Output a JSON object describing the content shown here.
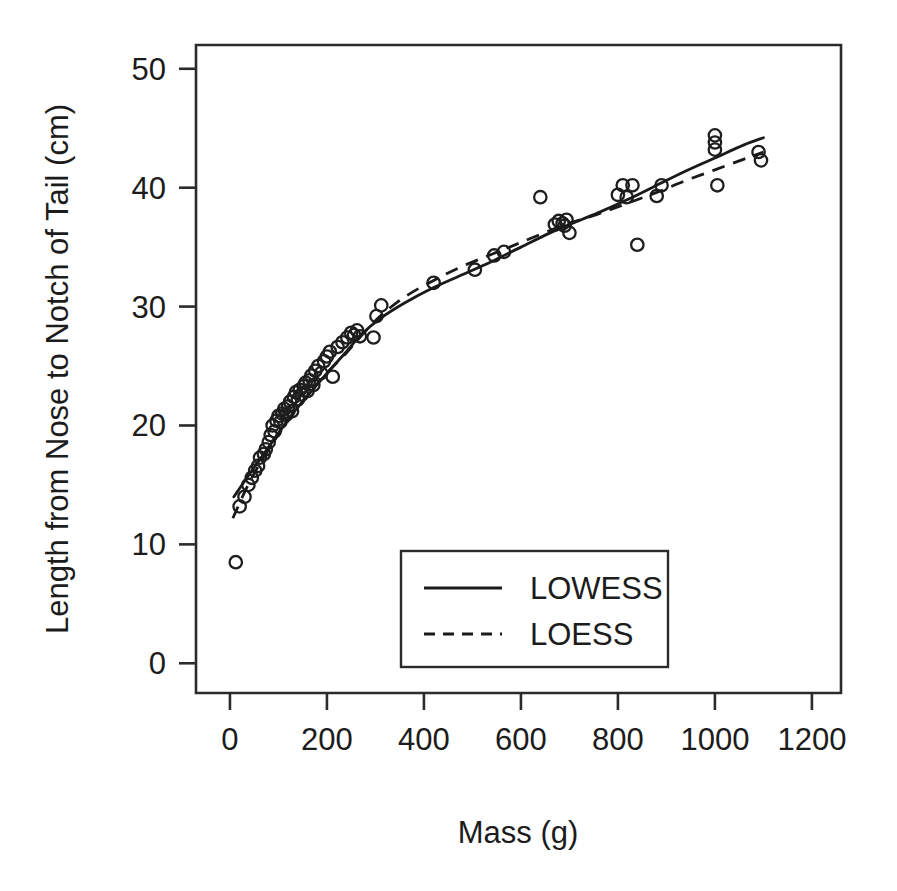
{
  "chart_data": {
    "type": "scatter",
    "title": "",
    "xlabel": "Mass (g)",
    "ylabel": "Length from Nose to Notch of Tail (cm)",
    "xlim": [
      -70,
      1260
    ],
    "ylim": [
      -2.5,
      52
    ],
    "xticks": [
      0,
      200,
      400,
      600,
      800,
      1000,
      1200
    ],
    "yticks": [
      0,
      10,
      20,
      30,
      40,
      50
    ],
    "xtick_labels": [
      "0",
      "200",
      "400",
      "600",
      "800",
      "1000",
      "1200"
    ],
    "ytick_labels": [
      "0",
      "10",
      "20",
      "30",
      "40",
      "50"
    ],
    "grid": false,
    "legend_position": "bottom-center-inside",
    "marker": "open-circle",
    "points": [
      [
        12,
        8.5
      ],
      [
        20,
        13.2
      ],
      [
        30,
        14.0
      ],
      [
        38,
        15.0
      ],
      [
        45,
        15.6
      ],
      [
        52,
        16.2
      ],
      [
        58,
        16.6
      ],
      [
        62,
        17.3
      ],
      [
        70,
        17.6
      ],
      [
        74,
        18.0
      ],
      [
        80,
        18.6
      ],
      [
        84,
        19.2
      ],
      [
        88,
        20.0
      ],
      [
        92,
        19.5
      ],
      [
        96,
        20.4
      ],
      [
        100,
        20.8
      ],
      [
        104,
        20.3
      ],
      [
        108,
        21.0
      ],
      [
        112,
        21.4
      ],
      [
        116,
        20.9
      ],
      [
        120,
        21.6
      ],
      [
        124,
        22.0
      ],
      [
        128,
        21.2
      ],
      [
        132,
        22.4
      ],
      [
        136,
        22.8
      ],
      [
        140,
        22.2
      ],
      [
        144,
        23.0
      ],
      [
        148,
        22.6
      ],
      [
        152,
        23.3
      ],
      [
        156,
        23.6
      ],
      [
        160,
        22.9
      ],
      [
        164,
        23.8
      ],
      [
        168,
        24.2
      ],
      [
        172,
        23.4
      ],
      [
        176,
        24.6
      ],
      [
        182,
        25.0
      ],
      [
        188,
        24.4
      ],
      [
        194,
        25.4
      ],
      [
        200,
        25.8
      ],
      [
        206,
        26.2
      ],
      [
        212,
        24.1
      ],
      [
        222,
        26.6
      ],
      [
        232,
        27.0
      ],
      [
        242,
        27.4
      ],
      [
        250,
        27.8
      ],
      [
        256,
        27.6
      ],
      [
        262,
        28.0
      ],
      [
        268,
        27.5
      ],
      [
        296,
        27.4
      ],
      [
        302,
        29.2
      ],
      [
        312,
        30.1
      ],
      [
        420,
        32.0
      ],
      [
        505,
        33.1
      ],
      [
        545,
        34.3
      ],
      [
        565,
        34.6
      ],
      [
        640,
        39.2
      ],
      [
        670,
        36.9
      ],
      [
        678,
        37.2
      ],
      [
        686,
        37.0
      ],
      [
        690,
        36.8
      ],
      [
        694,
        37.3
      ],
      [
        700,
        36.2
      ],
      [
        800,
        39.4
      ],
      [
        810,
        40.2
      ],
      [
        818,
        39.2
      ],
      [
        830,
        40.2
      ],
      [
        840,
        35.2
      ],
      [
        880,
        39.3
      ],
      [
        890,
        40.2
      ],
      [
        1000,
        44.4
      ],
      [
        1000,
        43.8
      ],
      [
        1000,
        43.2
      ],
      [
        1005,
        40.2
      ],
      [
        1090,
        43.0
      ],
      [
        1095,
        42.3
      ]
    ],
    "series": [
      {
        "name": "LOWESS",
        "style": "solid",
        "values": [
          [
            8,
            14.0
          ],
          [
            40,
            15.9
          ],
          [
            80,
            18.2
          ],
          [
            120,
            20.5
          ],
          [
            160,
            22.5
          ],
          [
            200,
            24.4
          ],
          [
            240,
            26.2
          ],
          [
            270,
            27.6
          ],
          [
            310,
            29.0
          ],
          [
            360,
            30.3
          ],
          [
            420,
            31.6
          ],
          [
            480,
            32.7
          ],
          [
            540,
            33.8
          ],
          [
            600,
            35.0
          ],
          [
            660,
            36.2
          ],
          [
            700,
            36.9
          ],
          [
            760,
            37.9
          ],
          [
            820,
            39.0
          ],
          [
            880,
            40.2
          ],
          [
            940,
            41.4
          ],
          [
            1000,
            42.5
          ],
          [
            1060,
            43.6
          ],
          [
            1100,
            44.2
          ]
        ]
      },
      {
        "name": "LOESS",
        "style": "dashed",
        "values": [
          [
            6,
            12.2
          ],
          [
            40,
            15.2
          ],
          [
            80,
            18.0
          ],
          [
            120,
            20.4
          ],
          [
            160,
            22.5
          ],
          [
            200,
            24.4
          ],
          [
            240,
            26.1
          ],
          [
            270,
            27.5
          ],
          [
            310,
            29.2
          ],
          [
            360,
            30.8
          ],
          [
            420,
            32.2
          ],
          [
            480,
            33.4
          ],
          [
            540,
            34.4
          ],
          [
            600,
            35.4
          ],
          [
            660,
            36.4
          ],
          [
            700,
            37.0
          ],
          [
            760,
            37.8
          ],
          [
            820,
            38.7
          ],
          [
            880,
            39.6
          ],
          [
            940,
            40.6
          ],
          [
            1000,
            41.5
          ],
          [
            1060,
            42.4
          ],
          [
            1100,
            43.0
          ]
        ]
      }
    ],
    "legend": [
      {
        "label": "LOWESS",
        "style": "solid"
      },
      {
        "label": "LOESS",
        "style": "dashed"
      }
    ]
  },
  "colors": {
    "background": "#ffffff",
    "axis": "#2b2b2b",
    "marker": "#1e1e1e",
    "curve": "#1a1a1a"
  }
}
